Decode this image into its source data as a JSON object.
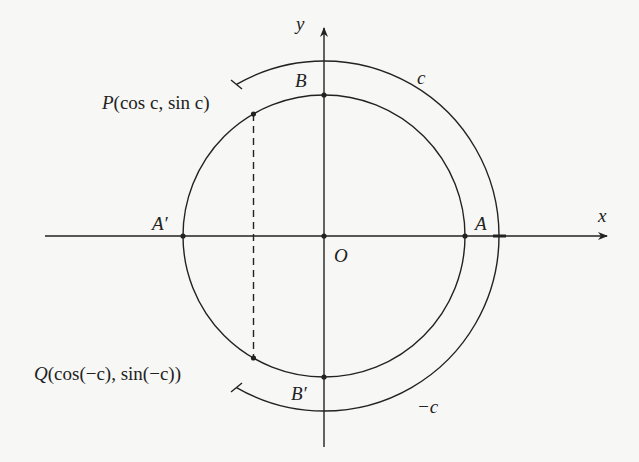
{
  "diagram": {
    "type": "unit-circle-symmetry",
    "axes": {
      "x_label": "x",
      "y_label": "y"
    },
    "origin_label": "O",
    "points": {
      "A": "A",
      "A_prime": "A′",
      "B": "B",
      "B_prime": "B′",
      "P": {
        "name": "P",
        "coords": "(cos c, sin c)"
      },
      "Q": {
        "name": "Q",
        "coords": "(cos(−c), sin(−c))"
      }
    },
    "arcs": {
      "upper": "c",
      "lower": "−c"
    },
    "angle_c_deg": 120,
    "colors": {
      "ink": "#222222",
      "paper": "#f7f7f5"
    }
  }
}
